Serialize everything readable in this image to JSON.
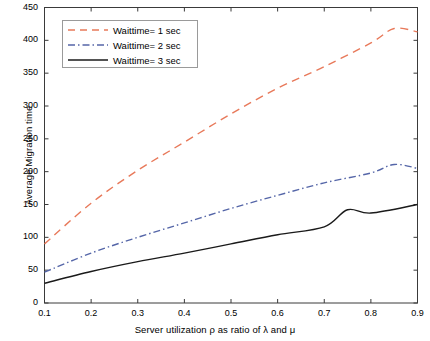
{
  "chart_data": {
    "type": "line",
    "title": "",
    "xlabel": "Server utilization ρ as ratio of λ and μ",
    "ylabel": "Average Migration time",
    "x": [
      0.1,
      0.2,
      0.3,
      0.4,
      0.5,
      0.6,
      0.7,
      0.8,
      0.9
    ],
    "xlim": [
      0.1,
      0.9
    ],
    "ylim": [
      0,
      450
    ],
    "xticks": [
      "0.1",
      "0.2",
      "0.3",
      "0.4",
      "0.5",
      "0.6",
      "0.7",
      "0.8",
      "0.9"
    ],
    "yticks": [
      "0",
      "50",
      "100",
      "150",
      "200",
      "250",
      "300",
      "350",
      "400",
      "450"
    ],
    "grid": false,
    "legend_position": "upper-left-inside",
    "series": [
      {
        "name": "Waittime= 1 sec",
        "color": "#e8795a",
        "style": "dashed",
        "values": [
          90,
          152,
          202,
          245,
          288,
          327,
          360,
          396,
          418
        ]
      },
      {
        "name": "Waittime= 2 sec",
        "color": "#5566a8",
        "style": "dashdot",
        "values": [
          47,
          76,
          100,
          122,
          144,
          164,
          183,
          198,
          207
        ]
      },
      {
        "name": "Waittime= 3 sec",
        "color": "#1a1a1a",
        "style": "solid",
        "values": [
          30,
          48,
          63,
          76,
          90,
          104,
          116,
          127,
          150
        ]
      }
    ],
    "series_detail": [
      {
        "name": "Waittime= 1 sec",
        "x": [
          0.1,
          0.2,
          0.3,
          0.4,
          0.5,
          0.6,
          0.7,
          0.8,
          0.85,
          0.9
        ],
        "values": [
          90,
          152,
          202,
          245,
          288,
          327,
          360,
          396,
          418,
          413
        ]
      },
      {
        "name": "Waittime= 2 sec",
        "x": [
          0.1,
          0.2,
          0.3,
          0.4,
          0.5,
          0.6,
          0.7,
          0.8,
          0.85,
          0.9
        ],
        "values": [
          47,
          76,
          100,
          122,
          144,
          164,
          183,
          198,
          211,
          205
        ]
      },
      {
        "name": "Waittime= 3 sec",
        "x": [
          0.1,
          0.2,
          0.3,
          0.4,
          0.5,
          0.6,
          0.7,
          0.75,
          0.8,
          0.9
        ],
        "values": [
          30,
          48,
          63,
          76,
          90,
          104,
          116,
          142,
          137,
          150
        ]
      }
    ]
  },
  "legend": {
    "items": [
      {
        "label": "Waittime= 1 sec"
      },
      {
        "label": "Waittime= 2 sec"
      },
      {
        "label": "Waittime= 3 sec"
      }
    ]
  },
  "axes": {
    "x_title": "Server utilization ρ as ratio of λ and μ",
    "y_title": "Average Migration time",
    "x_ticks": [
      "0.1",
      "0.2",
      "0.3",
      "0.4",
      "0.5",
      "0.6",
      "0.7",
      "0.8",
      "0.9"
    ],
    "y_ticks": [
      "450",
      "400",
      "350",
      "300",
      "250",
      "200",
      "150",
      "100",
      "50",
      "0"
    ]
  },
  "colors": {
    "series1": "#e8795a",
    "series2": "#5566a8",
    "series3": "#1a1a1a",
    "axis": "#3a3a3a",
    "background": "#ffffff"
  }
}
